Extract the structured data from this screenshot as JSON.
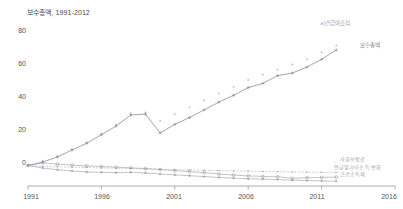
{
  "chart": {
    "title": "보수총액, 1991-2012",
    "axis": {
      "yticks": [
        "0",
        "20",
        "40",
        "60",
        "80"
      ],
      "xticks": [
        "1991",
        "1996",
        "2001",
        "2006",
        "2011",
        "2016"
      ]
    },
    "labels": {
      "scatter_top": "시간급여조적",
      "line_main": "보수총액",
      "low_1": "사회보험료",
      "low_2": "연금및기타소득 변화",
      "low_3": "근로소득세"
    },
    "colors": {
      "line_main": "#8c8c9c",
      "scatter_top": "#b9b9c8",
      "low_series": "#9a9aa8",
      "axis": "#9a9a9a",
      "text": "#555555"
    }
  },
  "chart_data": {
    "type": "line",
    "title": "보수총액, 1991-2012",
    "xlabel": "",
    "ylabel": "",
    "xlim": [
      1991,
      2016
    ],
    "ylim": [
      -12,
      85
    ],
    "grid": false,
    "legend_position": "inline-right",
    "x": [
      1991,
      1992,
      1993,
      1994,
      1995,
      1996,
      1997,
      1998,
      1999,
      2000,
      2001,
      2002,
      2003,
      2004,
      2005,
      2006,
      2007,
      2008,
      2009,
      2010,
      2011,
      2012
    ],
    "series": [
      {
        "name": "시간급여조적",
        "type": "scatter",
        "values": [
          0.5,
          2.5,
          5.5,
          9.5,
          13.5,
          18.5,
          24,
          30.5,
          31,
          26,
          30,
          34,
          38,
          42,
          46,
          50,
          53,
          56,
          59,
          62,
          66,
          70
        ]
      },
      {
        "name": "보수총액",
        "type": "line",
        "values": [
          0,
          2,
          5,
          9,
          13,
          18,
          23,
          29.5,
          30,
          19,
          24,
          28,
          32.5,
          37,
          41,
          45.5,
          48,
          52.5,
          54,
          57.5,
          62,
          67.5
        ]
      },
      {
        "name": "사회보험료",
        "type": "line",
        "values": [
          0,
          -0.5,
          -0.8,
          -1,
          -1.2,
          -1.5,
          -1.6,
          -1.8,
          -2,
          -2.2,
          -2.5,
          -2.6,
          -2.8,
          -3,
          -3.2,
          -3.3,
          -3.5,
          -3.6,
          -3.8,
          -3.9,
          -4,
          -4.1
        ]
      },
      {
        "name": "연금및기타소득 변화",
        "type": "line",
        "values": [
          0,
          1.5,
          0.8,
          0.2,
          -0.3,
          -0.6,
          -1,
          -1.4,
          -1.8,
          -2.4,
          -3,
          -3.6,
          -4.2,
          -5,
          -5.6,
          -6.1,
          -6.4,
          -6.6,
          -7.5,
          -7.2,
          -7,
          -6.8
        ]
      },
      {
        "name": "근로소득세",
        "type": "line",
        "values": [
          0,
          -1.5,
          -2.5,
          -3.2,
          -3.8,
          -4,
          -4.2,
          -4,
          -4.4,
          -5,
          -5.5,
          -6,
          -6.5,
          -7,
          -7.4,
          -7.8,
          -8,
          -8.2,
          -8.6,
          -8.8,
          -9,
          -9.2
        ]
      }
    ]
  }
}
